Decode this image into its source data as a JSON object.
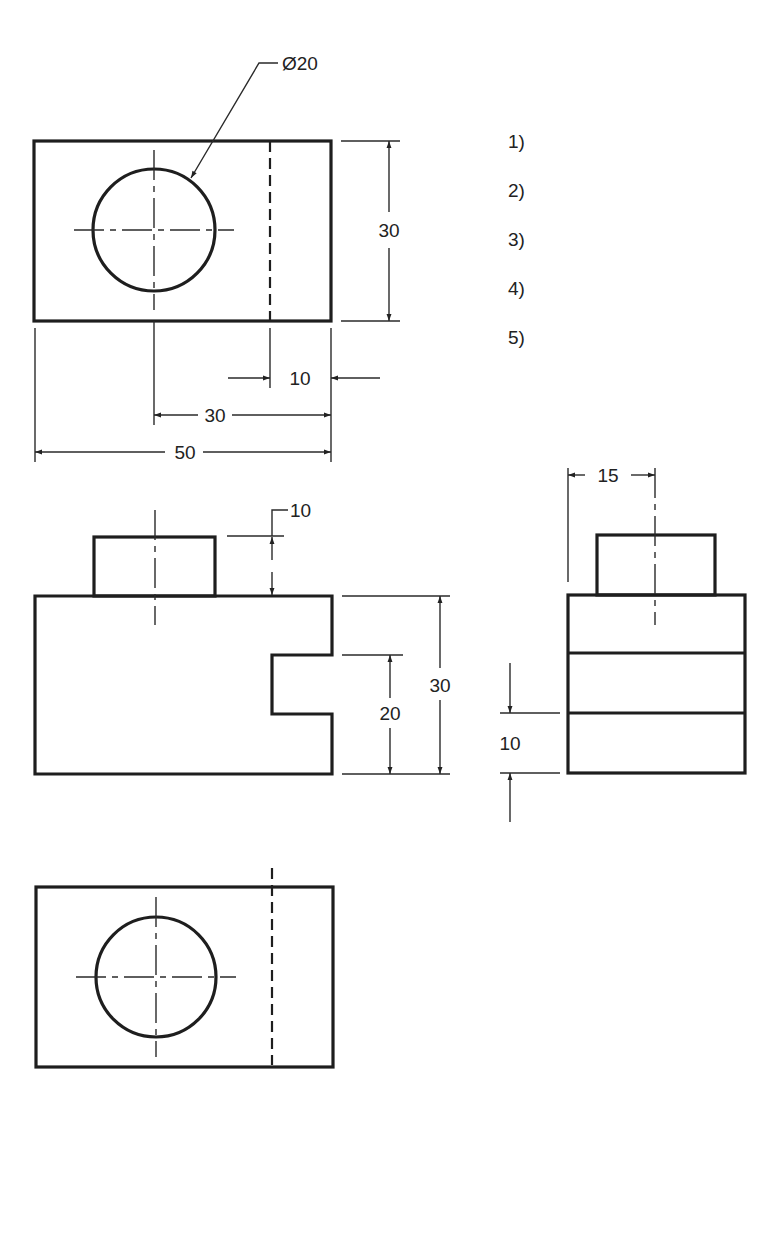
{
  "page": {
    "heading_partial": "",
    "question_items": [
      "1)",
      "2)",
      "3)",
      "4)",
      "5)"
    ]
  },
  "drawing": {
    "type": "orthographic-multiview",
    "colors": {
      "line": "#1e1e1e",
      "background": "#ffffff"
    },
    "top_view": {
      "hole_callout": "Ø20",
      "dims": {
        "height": "30",
        "offset_right": "10",
        "hole_to_right": "30",
        "overall_width": "50"
      }
    },
    "front_view": {
      "dims": {
        "boss_height": "10",
        "slot_height": "20",
        "overall_height": "30"
      }
    },
    "side_view": {
      "dims": {
        "boss_offset": "15",
        "layer_height": "10"
      }
    },
    "bottom_view": {}
  }
}
